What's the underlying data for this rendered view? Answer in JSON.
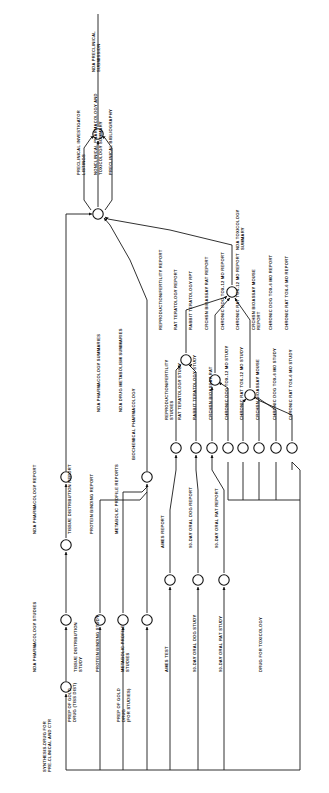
{
  "diagram": {
    "orientation": "rotated-90-ccw",
    "line_color": "#111111",
    "node_fill": "#ffffff",
    "background": "#ffffff"
  },
  "activities": {
    "start": "SYNTHESIS-DRUG FOR PRE-CLINICAL AND CTR",
    "prep_gold_tiss": "PREP OF GOLD DRUG (TISS DIST)",
    "prep_gold_studies": "PREP OF GOLD DRUG (FOR STUDIES)",
    "nda_pharm_studies": "NDA PHARMACOLOGY STUDIES",
    "nda_pharm_report": "NDA PHARMACOLOGY REPORT",
    "tissue_dist_study": "TISSUE DISTRIBUTION STUDY",
    "tissue_dist_report": "TISSUE DISTRIBUTION REPORT",
    "protein_binding_study": "PROTEIN BINDING STUDY",
    "protein_binding_report": "PROTEIN BINDING REPORT",
    "metabolic_profile_studies": "METABOLIC PROFILE STUDIES",
    "metabolic_profile_reports": "METABOLIC PROFILE REPORTS",
    "biochemical_pharmacology": "BIOCHEMICAL PHARMACOLOGY",
    "nda_drug_metab_summaries": "NDA DRUG METABOLISM SUMMARIES",
    "nda_pharm_summaries": "NDA PHARMACOLOGY SUMMARIES",
    "repro_fert_studies": "REPRODUCTION/FERTILITY STUDIES",
    "repro_fert_report": "REPRODUCTION/FERTILITY REPORT",
    "rat_terat_study": "RAT TERATOLOGY STUDY",
    "rat_terat_report": "RAT TERATOLOGY REPORT",
    "rabbit_terat_study": "RABBIT TERATOLOGY STUDY",
    "rabbit_terat_report": "RABBIT TERATOLOGY RPT",
    "carc_bioassay_rat_study": "CRCHSN BIOASSAY RAT",
    "carc_bioassay_rat_report": "CRCHSN BIOASSAY RAT REPORT",
    "chronic_dog_12_study": "CHRONIC DOG TOX-12 MO STUDY",
    "chronic_dog_12_report": "CHRONIC DOG TOX-12 MO REPORT",
    "chronic_rat_12_study": "CHRONIC RAT TOX-12 MO STUDY",
    "chronic_rat_12_report": "CHRONIC RAT TOX-12 MO REPORT",
    "carc_bioassay_mouse_study": "CRCHSN BIOASSAY MOUSE",
    "carc_bioassay_mouse_report": "CRCHSN BIOASSAY MOUSE REPORT",
    "chronic_dog_6_study": "CHRONIC DOG TOX-6 MO STUDY",
    "chronic_dog_6_report": "CHRONIC DOG TOX-6 MO REPORT",
    "chronic_rat_6_study": "CHRONIC RAT TOX-6 MO STUDY",
    "chronic_rat_6_report": "CHRONIC RAT TOX-6 MO REPORT",
    "ames_test": "AMES TEST",
    "ames_report": "AMES REPORT",
    "day90_dog_study": "90-DAY ORAL DOG STUDY",
    "day90_dog_report": "90-DAY ORAL DOG REPORT",
    "day90_rat_study": "90-DAY ORAL RAT STUDY",
    "day90_rat_report": "90-DAY ORAL RAT REPORT",
    "drug_for_tox": "DRUG FOR TOXICOLOGY",
    "nda_tox_summary": "NDA TOXICOLOGY SUMMARY",
    "preclin_investigator": "PRECLINICAL INVESTIGATOR LISTINGS",
    "nonclin_pharm_tox": "NONCLINICAL PHARMACOLOGY AND TOXICOLOGY SUMMARY",
    "preclin_biblio": "PRECLINICAL BIBLIOGRAPHY",
    "nda_preclin_submission": "NDA PRECLINICAL SUBMISSION"
  },
  "label_layout": [
    {
      "id": "start",
      "x": 46,
      "y": 772,
      "lines": [
        "SYNTHESIS-DRUG FOR",
        "PRE-CLINICAL AND CTR"
      ]
    },
    {
      "id": "prep_gold_tiss",
      "x": 71,
      "y": 722,
      "lines": [
        "PREP OF GOLD",
        "DRUG (TISS DIST)"
      ]
    },
    {
      "id": "prep_gold_studies",
      "x": 120,
      "y": 722,
      "lines": [
        "PREP OF GOLD",
        "DRUG",
        "(FOR STUDIES)"
      ]
    },
    {
      "id": "nda_pharm_studies",
      "x": 36,
      "y": 672,
      "lines": [
        "NDA PHARMACOLOGY STUDIES"
      ]
    },
    {
      "id": "nda_pharm_report",
      "x": 36,
      "y": 534,
      "lines": [
        "NDA PHARMACOLOGY REPORT"
      ]
    },
    {
      "id": "tissue_dist_study",
      "x": 77,
      "y": 672,
      "lines": [
        "TISSUE DISTRIBUTION",
        "STUDY"
      ]
    },
    {
      "id": "tissue_dist_report",
      "x": 71,
      "y": 534,
      "lines": [
        "TISSUE DISTRIBUTION REPORT"
      ]
    },
    {
      "id": "protein_binding_study",
      "x": 99,
      "y": 672,
      "lines": [
        "PROTEIN BINDING STUDY"
      ]
    },
    {
      "id": "protein_binding_report",
      "x": 93,
      "y": 534,
      "lines": [
        "PROTEIN BINDING REPORT"
      ]
    },
    {
      "id": "metabolic_profile_studies",
      "x": 124,
      "y": 672,
      "lines": [
        "METABOLIC PROFILE",
        "STUDIES"
      ]
    },
    {
      "id": "metabolic_profile_reports",
      "x": 118,
      "y": 534,
      "lines": [
        "METABOLIC PROFILE REPORTS"
      ]
    },
    {
      "id": "biochemical_pharmacology",
      "x": 135,
      "y": 460,
      "lines": [
        "BIOCHEMICAL PHARMACOLOGY"
      ]
    },
    {
      "id": "nda_drug_metab_summaries",
      "x": 122,
      "y": 412,
      "lines": [
        "NDA DRUG METABOLISM SUMMARIES"
      ]
    },
    {
      "id": "nda_pharm_summaries",
      "x": 100,
      "y": 412,
      "lines": [
        "NDA PHARMACOLOGY SUMMARIES"
      ]
    },
    {
      "id": "repro_fert_studies",
      "x": 168,
      "y": 420,
      "lines": [
        "REPRODUCTION/FERTILITY",
        "STUDIES"
      ]
    },
    {
      "id": "repro_fert_report",
      "x": 162,
      "y": 330,
      "lines": [
        "REPRODUCTION/FERTILITY REPORT"
      ]
    },
    {
      "id": "rat_terat_study",
      "x": 181,
      "y": 420,
      "lines": [
        "RAT TERATOLOGY STUDY"
      ]
    },
    {
      "id": "rat_terat_report",
      "x": 177,
      "y": 330,
      "lines": [
        "RAT TERATOLOGY REPORT"
      ]
    },
    {
      "id": "rabbit_terat_study",
      "x": 196,
      "y": 420,
      "lines": [
        "RABBIT TERATOLOGY STUDY"
      ]
    },
    {
      "id": "rabbit_terat_report",
      "x": 192,
      "y": 330,
      "lines": [
        "RABBIT TERATOLOGY RPT"
      ]
    },
    {
      "id": "carc_bioassay_rat_study",
      "x": 212,
      "y": 420,
      "lines": [
        "CRCHSN BIOASSAY RAT"
      ]
    },
    {
      "id": "carc_bioassay_rat_report",
      "x": 208,
      "y": 330,
      "lines": [
        "CRCHSN BIOASSAY RAT REPORT"
      ]
    },
    {
      "id": "chronic_dog_12_study",
      "x": 228,
      "y": 420,
      "lines": [
        "CHRONIC DOG TOX-12 MO STUDY"
      ]
    },
    {
      "id": "chronic_dog_12_report",
      "x": 224,
      "y": 330,
      "lines": [
        "CHRONIC DOG TOX-12 MO REPORT"
      ]
    },
    {
      "id": "chronic_rat_12_study",
      "x": 243,
      "y": 420,
      "lines": [
        "CHRONIC RAT TOX-12 MO STUDY"
      ]
    },
    {
      "id": "chronic_rat_12_report",
      "x": 239,
      "y": 330,
      "lines": [
        "CHRONIC RAT TOX-12 MO REPORT"
      ]
    },
    {
      "id": "carc_bioassay_mouse_study",
      "x": 259,
      "y": 420,
      "lines": [
        "CRCHSN BIOASSAY MOUSE"
      ]
    },
    {
      "id": "carc_bioassay_mouse_report",
      "x": 255,
      "y": 330,
      "lines": [
        "CRCHSN BIOASSAY MOUSE",
        "REPORT"
      ]
    },
    {
      "id": "chronic_dog_6_study",
      "x": 276,
      "y": 420,
      "lines": [
        "CHRONIC DOG TOX-6 MO STUDY"
      ]
    },
    {
      "id": "chronic_dog_6_report",
      "x": 272,
      "y": 330,
      "lines": [
        "CHRONIC DOG TOX-6 MO REPORT"
      ]
    },
    {
      "id": "chronic_rat_6_study",
      "x": 292,
      "y": 420,
      "lines": [
        "CHRONIC RAT TOX-6 MO STUDY"
      ]
    },
    {
      "id": "chronic_rat_6_report",
      "x": 288,
      "y": 330,
      "lines": [
        "CHRONIC RAT TOX-6 MO REPORT"
      ]
    },
    {
      "id": "ames_test",
      "x": 168,
      "y": 672,
      "lines": [
        "AMES TEST"
      ]
    },
    {
      "id": "ames_report",
      "x": 164,
      "y": 548,
      "lines": [
        "AMES REPORT"
      ]
    },
    {
      "id": "day90_dog_study",
      "x": 196,
      "y": 672,
      "lines": [
        "90-DAY ORAL DOG STUDY"
      ]
    },
    {
      "id": "day90_dog_report",
      "x": 192,
      "y": 548,
      "lines": [
        "90-DAY ORAL DOG REPORT"
      ]
    },
    {
      "id": "day90_rat_study",
      "x": 222,
      "y": 672,
      "lines": [
        "90-DAY ORAL RAT STUDY"
      ]
    },
    {
      "id": "day90_rat_report",
      "x": 218,
      "y": 548,
      "lines": [
        "90-DAY ORAL RAT REPORT"
      ]
    },
    {
      "id": "drug_for_tox",
      "x": 262,
      "y": 672,
      "lines": [
        "DRUG FOR TOXICOLOGY"
      ]
    },
    {
      "id": "nda_tox_summary",
      "x": 239,
      "y": 250,
      "lines": [
        "NDA TOXICOLOGY",
        "SUMMARY"
      ]
    },
    {
      "id": "preclin_investigator",
      "x": 80,
      "y": 175,
      "lines": [
        "PRECLINICAL INVESTIGATOR",
        "LISTINGS"
      ]
    },
    {
      "id": "nonclin_pharm_tox",
      "x": 97,
      "y": 175,
      "lines": [
        "NONCLINICAL PHARMACOLOGY AND",
        "TOXICOLOGY SUMMARY"
      ]
    },
    {
      "id": "preclin_biblio",
      "x": 112,
      "y": 175,
      "lines": [
        "PRECLINICAL BIBLIOGRAPHY"
      ]
    },
    {
      "id": "nda_preclin_submission",
      "x": 95,
      "y": 72,
      "lines": [
        "NDA PRECLINICAL",
        "SUBMISSION"
      ]
    }
  ],
  "nodes": [
    {
      "id": "n1",
      "cx": 66,
      "cy": 687
    },
    {
      "id": "n2",
      "cx": 66,
      "cy": 620
    },
    {
      "id": "n3",
      "cx": 66,
      "cy": 545
    },
    {
      "id": "n4",
      "cx": 66,
      "cy": 477
    },
    {
      "id": "n5",
      "cx": 100,
      "cy": 620
    },
    {
      "id": "n6",
      "cx": 123,
      "cy": 620
    },
    {
      "id": "n7",
      "cx": 147,
      "cy": 620
    },
    {
      "id": "n8",
      "cx": 147,
      "cy": 477
    },
    {
      "id": "n9",
      "cx": 176,
      "cy": 448
    },
    {
      "id": "n10",
      "cx": 196,
      "cy": 448
    },
    {
      "id": "n11",
      "cx": 212,
      "cy": 448
    },
    {
      "id": "n12",
      "cx": 228,
      "cy": 448
    },
    {
      "id": "n13",
      "cx": 243,
      "cy": 448
    },
    {
      "id": "n14",
      "cx": 259,
      "cy": 448
    },
    {
      "id": "n15",
      "cx": 276,
      "cy": 448
    },
    {
      "id": "n16",
      "cx": 292,
      "cy": 448
    },
    {
      "id": "n17",
      "cx": 186,
      "cy": 360
    },
    {
      "id": "n18",
      "cx": 215,
      "cy": 380
    },
    {
      "id": "n19",
      "cx": 250,
      "cy": 395
    },
    {
      "id": "n20",
      "cx": 232,
      "cy": 292
    },
    {
      "id": "n21",
      "cx": 170,
      "cy": 580
    },
    {
      "id": "n22",
      "cx": 198,
      "cy": 580
    },
    {
      "id": "n23",
      "cx": 224,
      "cy": 580
    },
    {
      "id": "n24",
      "cx": 98,
      "cy": 214
    },
    {
      "id": "n25",
      "cx": 98,
      "cy": 134
    }
  ]
}
